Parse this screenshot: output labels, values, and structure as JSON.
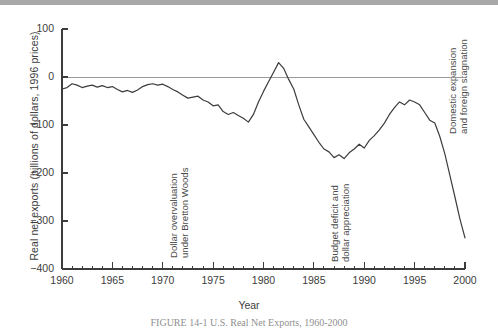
{
  "figure": {
    "caption": "FIGURE 14-1  U.S. Real Net Exports, 1960-2000"
  },
  "chart_data": {
    "type": "line",
    "title": "",
    "xlabel": "Year",
    "ylabel": "Real net exports (billions of dollars, 1996 prices)",
    "xlim": [
      1960,
      2000
    ],
    "ylim": [
      -400,
      100
    ],
    "grid": false,
    "legend": "none",
    "zero_line": 0,
    "y_ticks": [
      100,
      0,
      -100,
      -200,
      -300,
      -400
    ],
    "y_tick_labels": [
      "100",
      "0",
      "-100",
      "-200",
      "-300",
      "-400"
    ],
    "x_ticks": [
      1960,
      1965,
      1970,
      1975,
      1980,
      1985,
      1990,
      1995,
      2000
    ],
    "x_tick_labels": [
      "1960",
      "1965",
      "1970",
      "1975",
      "1980",
      "1985",
      "1990",
      "1995",
      "2000"
    ],
    "x_minor_tick_step": 1,
    "line_color": "#3c3c3c",
    "series": [
      {
        "name": "Real net exports",
        "x": [
          1960,
          1960.5,
          1961,
          1961.5,
          1962,
          1962.5,
          1963,
          1963.5,
          1964,
          1964.5,
          1965,
          1965.5,
          1966,
          1966.5,
          1967,
          1967.5,
          1968,
          1968.5,
          1969,
          1969.5,
          1970,
          1970.5,
          1971,
          1971.5,
          1972,
          1972.5,
          1973,
          1973.5,
          1974,
          1974.5,
          1975,
          1975.5,
          1976,
          1976.5,
          1977,
          1977.5,
          1978,
          1978.5,
          1979,
          1979.5,
          1980,
          1980.5,
          1981,
          1981.5,
          1982,
          1982.5,
          1983,
          1983.5,
          1984,
          1984.5,
          1985,
          1985.5,
          1986,
          1986.5,
          1987,
          1987.5,
          1988,
          1988.5,
          1989,
          1989.5,
          1990,
          1990.5,
          1991,
          1991.5,
          1992,
          1992.5,
          1993,
          1993.5,
          1994,
          1994.5,
          1995,
          1995.5,
          1996,
          1996.5,
          1997,
          1997.5,
          1998,
          1998.5,
          1999,
          1999.5,
          2000
        ],
        "values": [
          -25,
          -22,
          -14,
          -17,
          -22,
          -19,
          -17,
          -21,
          -18,
          -22,
          -20,
          -26,
          -31,
          -28,
          -32,
          -27,
          -20,
          -16,
          -14,
          -17,
          -15,
          -20,
          -26,
          -31,
          -38,
          -44,
          -42,
          -40,
          -48,
          -52,
          -60,
          -58,
          -72,
          -78,
          -74,
          -80,
          -86,
          -94,
          -78,
          -52,
          -30,
          -10,
          10,
          30,
          18,
          -5,
          -25,
          -58,
          -88,
          -104,
          -120,
          -136,
          -150,
          -156,
          -168,
          -162,
          -170,
          -158,
          -150,
          -140,
          -148,
          -132,
          -122,
          -110,
          -96,
          -78,
          -64,
          -52,
          -58,
          -48,
          -52,
          -58,
          -74,
          -90,
          -96,
          -124,
          -160,
          -205,
          -250,
          -296,
          -335
        ]
      }
    ],
    "annotations": [
      {
        "id": "bretton-woods",
        "text": "Dollar overvaluation\nunder Bretton Woods",
        "rotation": -90,
        "x_px": 168,
        "y_px": 258
      },
      {
        "id": "budget-deficit",
        "text": "Budget deficit and\ndollar appreciation",
        "rotation": -90,
        "x_px": 329,
        "y_px": 262
      },
      {
        "id": "domestic-expansion",
        "text": "Domestic expansion\nand foreign stagnation",
        "rotation": -90,
        "x_px": 447,
        "y_px": 134
      }
    ]
  }
}
